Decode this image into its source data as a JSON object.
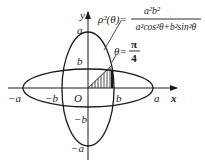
{
  "diagram": {
    "type": "polar-region",
    "axes": {
      "x_label": "x",
      "y_label": "y",
      "origin_label": "O"
    },
    "tick_labels": {
      "x_pos_a": "a",
      "x_neg_a": "−a",
      "x_pos_b": "b",
      "x_neg_b": "−b",
      "y_pos_a": "a",
      "y_neg_a": "−a",
      "y_pos_b": "b",
      "y_neg_b": "−b"
    },
    "formula": {
      "lhs": "ρ²(θ)=",
      "numerator": "a²b²",
      "denominator": "a²cos²θ+b²sin²θ"
    },
    "angle_label": {
      "lhs": "θ=",
      "numerator": "π",
      "denominator": "4"
    },
    "colors": {
      "stroke": "#1a1a1a",
      "background": "#ffffff"
    }
  }
}
